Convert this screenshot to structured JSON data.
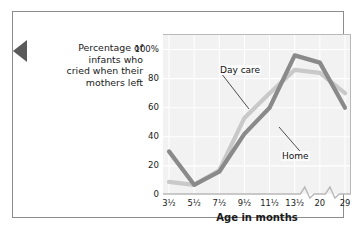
{
  "figure": {
    "left_tab_icon": "left-pointer-triangle"
  },
  "chart_data": {
    "type": "line",
    "title": "",
    "xlabel": "Age in months",
    "ylabel": "Percentage of infants who cried when their mothers left",
    "ylabel_lines": [
      "Percentage of",
      "infants who",
      "cried when their",
      "mothers left"
    ],
    "categories": [
      "3½",
      "5½",
      "7½",
      "9½",
      "11½",
      "13½",
      "20",
      "29"
    ],
    "x_axis_has_break": true,
    "x_break_positions": [
      "before-20",
      "before-29"
    ],
    "ylim": [
      0,
      110
    ],
    "yticks": [
      0,
      20,
      40,
      60,
      80,
      100
    ],
    "ytick_labels": [
      "0",
      "20",
      "40",
      "60",
      "80",
      "100%"
    ],
    "grid": true,
    "legend": "inline-annotations",
    "series": [
      {
        "name": "Day care",
        "color": "#c9c9c9",
        "values": [
          9,
          7,
          17,
          53,
          70,
          86,
          84,
          70
        ],
        "label_x": "9½",
        "label_position": "upper-left"
      },
      {
        "name": "Home",
        "color": "#8a8a8a",
        "values": [
          30,
          7,
          16,
          42,
          60,
          96,
          91,
          60
        ],
        "label_x": "11½",
        "label_position": "lower-right"
      }
    ],
    "colors": {
      "plot_background": "#f2f2f2",
      "gridline": "#ffffff",
      "axis": "#b9b9b9",
      "day_care": "#c9c9c9",
      "home": "#8a8a8a"
    }
  }
}
